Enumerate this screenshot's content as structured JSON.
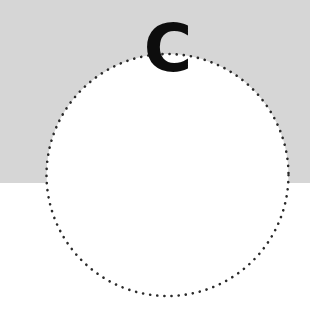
{
  "scene": {
    "background_top_color": "#d6d6d6",
    "background_bottom_color": "#ffffff",
    "split_y": 183
  },
  "circle": {
    "shape": "dotted-circle",
    "center_x": 167.5,
    "center_y": 175,
    "radius": 121,
    "fill": "#ffffff",
    "dot_color": "#2a2a2a",
    "dot_spacing": 7
  },
  "label": {
    "text": "C",
    "color": "#0d0d0d"
  }
}
